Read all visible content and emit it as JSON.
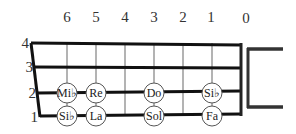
{
  "fret_numbers": [
    {
      "label": "6",
      "x": 67
    },
    {
      "label": "5",
      "x": 96
    },
    {
      "label": "4",
      "x": 125
    },
    {
      "label": "3",
      "x": 154
    },
    {
      "label": "2",
      "x": 183
    },
    {
      "label": "1",
      "x": 212
    },
    {
      "label": "0",
      "x": 246
    }
  ],
  "string_numbers": [
    {
      "label": "4",
      "y": 43
    },
    {
      "label": "3",
      "y": 67
    },
    {
      "label": "2",
      "y": 93
    },
    {
      "label": "1",
      "y": 116
    }
  ],
  "notes": [
    {
      "label": "Mi♭",
      "string": 2,
      "fret": 6,
      "x": 67,
      "y": 93
    },
    {
      "label": "Re",
      "string": 2,
      "fret": 5,
      "x": 96,
      "y": 93
    },
    {
      "label": "Do",
      "string": 2,
      "fret": 3,
      "x": 154,
      "y": 93
    },
    {
      "label": "Si♭",
      "string": 2,
      "fret": 1,
      "x": 212,
      "y": 93
    },
    {
      "label": "Si♭",
      "string": 1,
      "fret": 6,
      "x": 67,
      "y": 116
    },
    {
      "label": "La",
      "string": 1,
      "fret": 5,
      "x": 96,
      "y": 116
    },
    {
      "label": "Sol",
      "string": 1,
      "fret": 3,
      "x": 154,
      "y": 116
    },
    {
      "label": "Fa",
      "string": 1,
      "fret": 1,
      "x": 212,
      "y": 116
    }
  ],
  "colors": {
    "string": "#111111",
    "fret": "#9a9a9a",
    "nut": "#222222",
    "bracket": "#333333"
  }
}
